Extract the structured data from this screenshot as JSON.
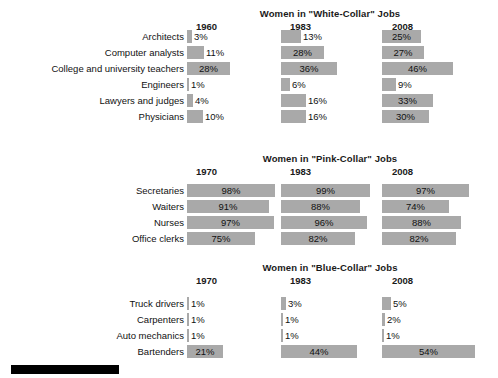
{
  "chart_data": [
    {
      "type": "bar",
      "title": "Women in \"White-Collar\" Jobs",
      "xlabel": "",
      "ylabel": "",
      "orientation": "horizontal",
      "value_suffix": "%",
      "columns": [
        "1960",
        "1983",
        "2008"
      ],
      "categories": [
        "Architects",
        "Computer analysts",
        "College and university teachers",
        "Engineers",
        "Lawyers and judges",
        "Physicians"
      ],
      "series": [
        {
          "name": "1960",
          "values": [
            3,
            11,
            28,
            1,
            4,
            10
          ],
          "labels": [
            "3%",
            "11%",
            "28%",
            "1%",
            "4%",
            "10%"
          ]
        },
        {
          "name": "1983",
          "values": [
            13,
            28,
            36,
            6,
            16,
            16
          ],
          "labels": [
            "13%",
            "28%",
            "36%",
            "6%",
            "16%",
            "16%"
          ]
        },
        {
          "name": "2008",
          "values": [
            25,
            27,
            46,
            9,
            33,
            30
          ],
          "labels": [
            "25%",
            "27%",
            "46%",
            "9%",
            "33%",
            "30%"
          ]
        }
      ]
    },
    {
      "type": "bar",
      "title": "Women in \"Pink-Collar\" Jobs",
      "xlabel": "",
      "ylabel": "",
      "orientation": "horizontal",
      "value_suffix": "%",
      "columns": [
        "1970",
        "1983",
        "2008"
      ],
      "categories": [
        "Secretaries",
        "Waiters",
        "Nurses",
        "Office clerks"
      ],
      "series": [
        {
          "name": "1970",
          "values": [
            98,
            91,
            97,
            75
          ],
          "labels": [
            "98%",
            "91%",
            "97%",
            "75%"
          ]
        },
        {
          "name": "1983",
          "values": [
            99,
            88,
            96,
            82
          ],
          "labels": [
            "99%",
            "88%",
            "96%",
            "82%"
          ]
        },
        {
          "name": "2008",
          "values": [
            97,
            74,
            88,
            82
          ],
          "labels": [
            "97%",
            "74%",
            "88%",
            "82%"
          ]
        }
      ]
    },
    {
      "type": "bar",
      "title": "Women in \"Blue-Collar\" Jobs",
      "xlabel": "",
      "ylabel": "",
      "orientation": "horizontal",
      "value_suffix": "%",
      "columns": [
        "1970",
        "1983",
        "2008"
      ],
      "categories": [
        "Truck drivers",
        "Carpenters",
        "Auto mechanics",
        "Bartenders"
      ],
      "series": [
        {
          "name": "1970",
          "values": [
            1,
            1,
            1,
            21
          ],
          "labels": [
            "1%",
            "1%",
            "1%",
            "21%"
          ]
        },
        {
          "name": "1983",
          "values": [
            3,
            1,
            1,
            44
          ],
          "labels": [
            "3%",
            "1%",
            "1%",
            "44%"
          ]
        },
        {
          "name": "2008",
          "values": [
            5,
            2,
            1,
            54
          ],
          "labels": [
            "5%",
            "2%",
            "1%",
            "54%"
          ]
        }
      ]
    }
  ],
  "style": {
    "bar_color": "#a9a9a9",
    "text_color": "#111111",
    "background": "#ffffff",
    "footer_bar_color": "#000000"
  },
  "layout": {
    "blocks": [
      {
        "top": 8,
        "rows_top": 29,
        "label_right": 314,
        "col_x": [
          187,
          281,
          382
        ],
        "scale": 1.55,
        "title_center": 330
      },
      {
        "top": 153,
        "rows_top": 183,
        "label_right": 314,
        "col_x": [
          187,
          281,
          382
        ],
        "scale": 0.9,
        "title_center": 330
      },
      {
        "top": 262,
        "rows_top": 296,
        "label_right": 314,
        "col_x": [
          187,
          281,
          382
        ],
        "scale": 1.72,
        "title_center": 330
      }
    ],
    "year_x": [
      [
        196,
        290,
        392
      ],
      [
        196,
        290,
        392
      ],
      [
        196,
        290,
        392
      ]
    ]
  }
}
